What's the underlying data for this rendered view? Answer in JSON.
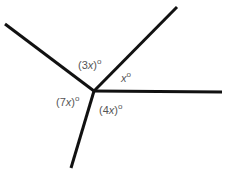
{
  "diagram": {
    "type": "angles-at-a-point",
    "center": [
      94,
      91
    ],
    "rays": [
      {
        "name": "ray-upper-left",
        "end": [
          5,
          24
        ]
      },
      {
        "name": "ray-upper-right",
        "end": [
          177,
          7
        ]
      },
      {
        "name": "ray-right",
        "end": [
          222,
          92
        ]
      },
      {
        "name": "ray-down",
        "end": [
          71,
          168
        ]
      }
    ],
    "labels": [
      {
        "name": "angle-3x",
        "pre": "(3",
        "var": "x",
        "post": ")",
        "deg": "o"
      },
      {
        "name": "angle-x",
        "pre": "",
        "var": "x",
        "post": "",
        "deg": "o"
      },
      {
        "name": "angle-7x",
        "pre": "(7",
        "var": "x",
        "post": ")",
        "deg": "o"
      },
      {
        "name": "angle-4x",
        "pre": "(4",
        "var": "x",
        "post": ")",
        "deg": "o"
      }
    ],
    "line_color": "#111111",
    "label_color": "#555555"
  }
}
